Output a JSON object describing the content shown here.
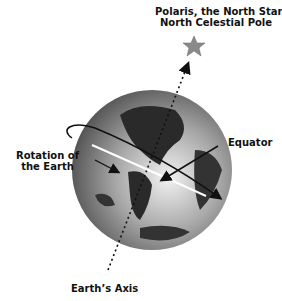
{
  "labels": {
    "polaris_line1": "Polaris, the North Star",
    "polaris_line2": "North Celestial Pole",
    "rotation_line1": "Rotation of",
    "rotation_line2": "the Earth",
    "equator": "Equator",
    "axis": "Earth’s Axis"
  },
  "colors": {
    "star": "#8a8a8a",
    "globe_ocean": "#9a9a9a",
    "globe_land": "#2a2a2a",
    "arrows": "#111111",
    "equator_line": "#ffffff"
  }
}
